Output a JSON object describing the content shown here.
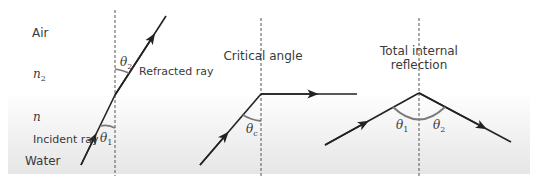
{
  "medium_labels": {
    "air": "Air",
    "water": "Water",
    "n2_symbol": "n",
    "n2_sub": "2",
    "n_symbol": "n"
  },
  "diagram_refraction": {
    "refracted_label": "Refracted ray",
    "incident_label": "Incident ray",
    "theta2_symbol": "θ",
    "theta2_sub": "2",
    "theta1_symbol": "θ",
    "theta1_sub": "1"
  },
  "diagram_critical": {
    "title": "Critical angle",
    "thetac_symbol": "θ",
    "thetac_sub": "c"
  },
  "diagram_tir": {
    "title_line1": "Total internal",
    "title_line2": "reflection",
    "theta1_symbol": "θ",
    "theta1_sub": "1",
    "theta2_symbol": "θ",
    "theta2_sub": "2"
  },
  "colors": {
    "ray": "#222222",
    "arc": "#7a7a7a",
    "normal": "#555555",
    "water_top": "#ffffff",
    "water_bottom": "#e6e6e6"
  }
}
